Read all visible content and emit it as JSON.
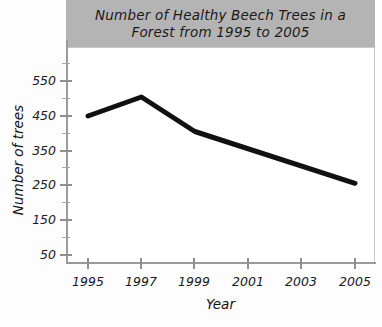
{
  "chart_data": {
    "type": "line",
    "title": "Number of Healthy Beech Trees in a Forest from 1995 to 2005",
    "title_lines": [
      "Number of Healthy Beech Trees in a",
      "Forest from 1995 to 2005"
    ],
    "xlabel": "Year",
    "ylabel": "Number of trees",
    "x": [
      1995,
      1997,
      1999,
      2001,
      2003,
      2005
    ],
    "values": [
      450,
      505,
      405,
      355,
      305,
      255
    ],
    "vertices": [
      {
        "x": 1995,
        "y": 450
      },
      {
        "x": 1997,
        "y": 505
      },
      {
        "x": 1999,
        "y": 405
      },
      {
        "x": 2005,
        "y": 255
      }
    ],
    "xtick_labels": [
      "1995",
      "1997",
      "1999",
      "2001",
      "2003",
      "2005"
    ],
    "ytick_labels": [
      "50",
      "150",
      "250",
      "350",
      "450",
      "550"
    ],
    "ytick_values": [
      50,
      150,
      250,
      350,
      450,
      550
    ],
    "yminor_values": [
      100,
      200,
      300,
      400,
      500
    ],
    "xlim": [
      1994,
      2006
    ],
    "ylim": [
      0,
      600
    ],
    "grid": false,
    "legend": null,
    "line_color": "#111111",
    "title_band_color": "#b4b4b4",
    "plot_background": "#ffffff"
  }
}
